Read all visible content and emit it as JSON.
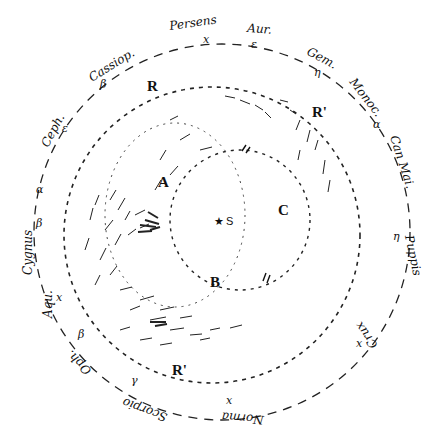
{
  "diagram": {
    "type": "hand-drawn astronomical sky/galaxy diagram",
    "center_label": "S",
    "center_marker": "star",
    "region_labels": [
      {
        "id": "A",
        "text": "A"
      },
      {
        "id": "B",
        "text": "B"
      },
      {
        "id": "C",
        "text": "C"
      },
      {
        "id": "R-top",
        "text": "R"
      },
      {
        "id": "R-right",
        "text": "R'"
      },
      {
        "id": "R-bottom",
        "text": "R'"
      }
    ],
    "constellations": [
      {
        "name": "Persens",
        "star": "x"
      },
      {
        "name": "Aur.",
        "star": "ε"
      },
      {
        "name": "Gem.",
        "star": "η"
      },
      {
        "name": "Monoc.",
        "star": ""
      },
      {
        "name": "Can Mai.",
        "star": "α"
      },
      {
        "name": "Puppis",
        "star": "η"
      },
      {
        "name": "Crux",
        "star": "x"
      },
      {
        "name": "Norma",
        "star": "x"
      },
      {
        "name": "Scorpio",
        "star": "γ"
      },
      {
        "name": "Oph.",
        "star": "β"
      },
      {
        "name": "Aqu.",
        "star": "x"
      },
      {
        "name": "Cygnus",
        "star": "β"
      },
      {
        "name": "Ceph.",
        "star": "ε"
      },
      {
        "name": "Cassiop.",
        "star": "β"
      }
    ],
    "extra_star_labels": [
      {
        "text": "α",
        "near": "Cygnus"
      },
      {
        "text": "α",
        "near": "Oph."
      }
    ]
  }
}
